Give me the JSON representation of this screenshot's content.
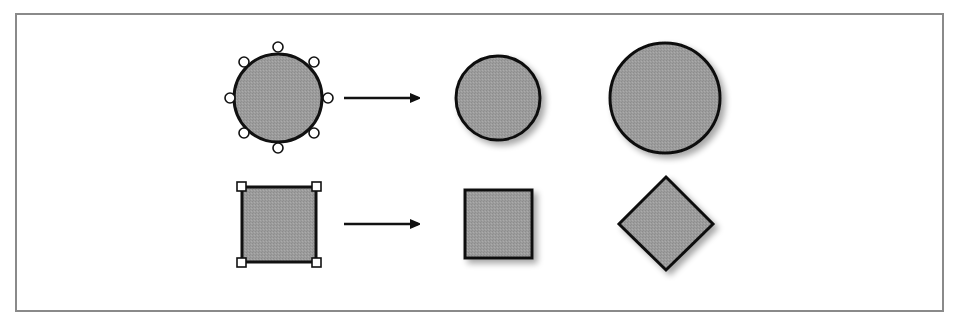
{
  "diagram": {
    "colors": {
      "fill": "#9a9a9a",
      "stroke": "#111111",
      "frame": "#8a8a8a",
      "handle_fill": "#ffffff",
      "shadow": "#c8c8c8"
    },
    "rows": [
      {
        "name": "circle-row",
        "selected_shape": "circle-with-8-round-handles",
        "arrow": "right-arrow",
        "result_shape": "circle",
        "transformed_shape": "enlarged-circle"
      },
      {
        "name": "square-row",
        "selected_shape": "square-with-4-square-handles",
        "arrow": "right-arrow",
        "result_shape": "square",
        "transformed_shape": "rotated-square-diamond"
      }
    ]
  }
}
